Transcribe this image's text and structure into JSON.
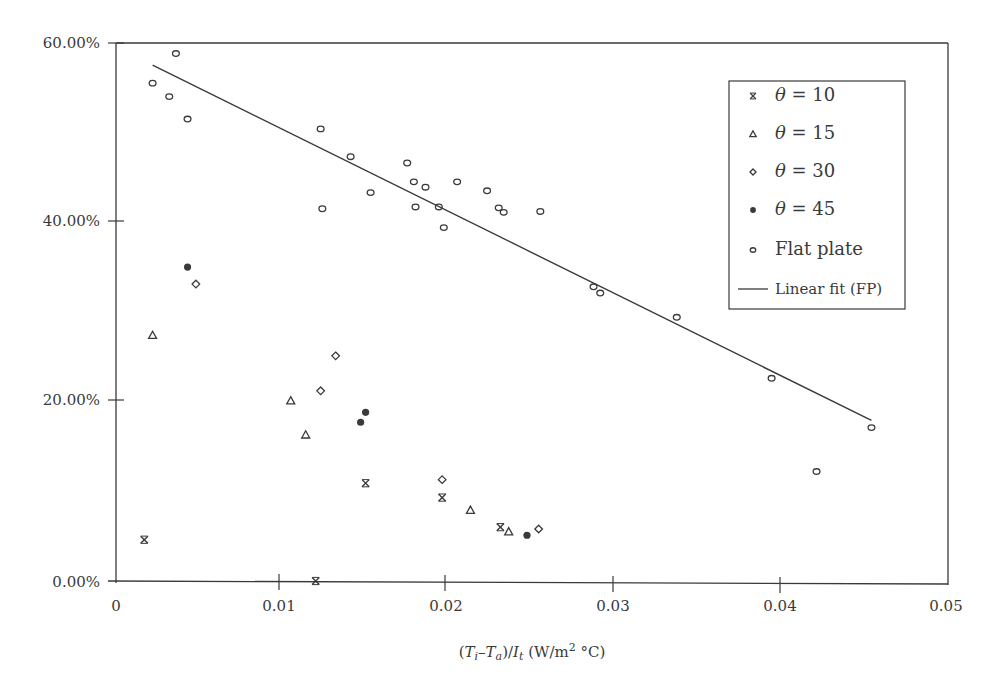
{
  "chart_data": {
    "type": "scatter",
    "title": "",
    "xlabel": "(Ti−Ta)/It (W/m2 °C)",
    "ylabel": "",
    "xlim": [
      0,
      0.05
    ],
    "ylim": [
      0,
      60
    ],
    "x_ticks": [
      "0",
      "0.01",
      "0.02",
      "0.03",
      "0.04",
      "0.05"
    ],
    "y_ticks": [
      "0.00%",
      "20.00%",
      "40.00%",
      "60.00%"
    ],
    "grid": false,
    "legend_position": "upper right",
    "series": [
      {
        "name": "θ = 10",
        "marker": "asterisk",
        "points": [
          [
            0.0017,
            4.6
          ],
          [
            0.012,
            0.0
          ],
          [
            0.015,
            10.9
          ],
          [
            0.0196,
            9.3
          ],
          [
            0.0231,
            6.0
          ]
        ]
      },
      {
        "name": "θ = 15",
        "marker": "triangle",
        "points": [
          [
            0.0022,
            27.4
          ],
          [
            0.0105,
            20.1
          ],
          [
            0.0114,
            16.3
          ],
          [
            0.0213,
            7.9
          ],
          [
            0.0236,
            5.5
          ]
        ]
      },
      {
        "name": "θ = 30",
        "marker": "diamond",
        "points": [
          [
            0.0048,
            33.1
          ],
          [
            0.0132,
            25.1
          ],
          [
            0.0123,
            21.2
          ],
          [
            0.0196,
            11.3
          ],
          [
            0.0254,
            5.8
          ]
        ]
      },
      {
        "name": "θ = 45",
        "marker": "filled-circle",
        "points": [
          [
            0.0043,
            35.0
          ],
          [
            0.015,
            18.8
          ],
          [
            0.0147,
            17.7
          ],
          [
            0.0247,
            5.1
          ]
        ]
      },
      {
        "name": "Flat plate",
        "marker": "open-circle",
        "points": [
          [
            0.0022,
            55.5
          ],
          [
            0.0036,
            58.8
          ],
          [
            0.0032,
            54.0
          ],
          [
            0.0043,
            51.5
          ],
          [
            0.0123,
            50.4
          ],
          [
            0.0141,
            47.3
          ],
          [
            0.0124,
            41.5
          ],
          [
            0.0153,
            43.3
          ],
          [
            0.0175,
            46.6
          ],
          [
            0.0179,
            44.5
          ],
          [
            0.0186,
            43.9
          ],
          [
            0.018,
            41.7
          ],
          [
            0.0194,
            41.7
          ],
          [
            0.0197,
            39.4
          ],
          [
            0.0205,
            44.5
          ],
          [
            0.0223,
            43.5
          ],
          [
            0.023,
            41.6
          ],
          [
            0.0233,
            41.1
          ],
          [
            0.0255,
            41.2
          ],
          [
            0.0287,
            32.8
          ],
          [
            0.0291,
            32.1
          ],
          [
            0.0337,
            29.4
          ],
          [
            0.0394,
            22.6
          ],
          [
            0.0421,
            12.2
          ],
          [
            0.0454,
            17.1
          ]
        ]
      },
      {
        "name": "Linear fit (FP)",
        "marker": "line",
        "points": [
          [
            0.0022,
            57.5
          ],
          [
            0.0454,
            17.9
          ]
        ]
      }
    ]
  },
  "axes": {
    "x_tick_labels": [
      "0",
      "0.01",
      "0.02",
      "0.03",
      "0.04",
      "0.05"
    ],
    "y_tick_labels": [
      "0.00%",
      "20.00%",
      "40.00%",
      "60.00%"
    ],
    "xlabel_parts": {
      "open": "(",
      "t1": "T",
      "s1": "i",
      "minus": "–",
      "t2": "T",
      "s2": "a",
      "mid": ")/",
      "t3": "I",
      "s3": "t",
      "unit": " (W/m",
      "sup": "2",
      "unit_end": " °C)"
    }
  },
  "legend": {
    "items": [
      {
        "label_value": " = 10",
        "marker": "asterisk"
      },
      {
        "label_value": " = 15",
        "marker": "triangle"
      },
      {
        "label_value": " = 30",
        "marker": "diamond"
      },
      {
        "label_value": " = 45",
        "marker": "filled-circle"
      },
      {
        "label": "Flat plate",
        "marker": "open-circle"
      },
      {
        "label": "Linear fit (FP)",
        "marker": "line"
      }
    ],
    "theta_symbol": "θ"
  },
  "colors": {
    "ink": "#3a3a3a",
    "background": "#ffffff"
  }
}
